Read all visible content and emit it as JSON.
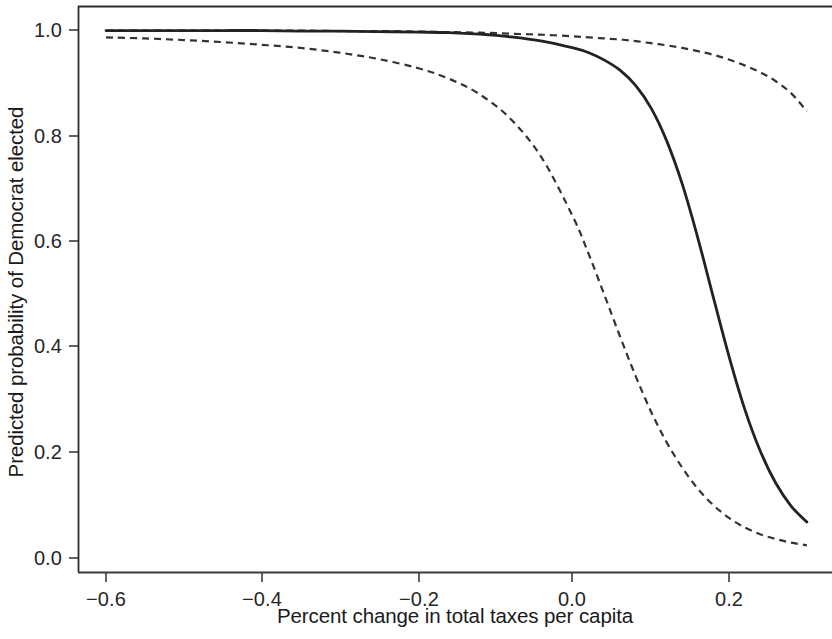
{
  "chart_data": {
    "type": "line",
    "title": "",
    "xlabel": "Percent change in total taxes per capita",
    "ylabel": "Predicted probability of Democrat elected",
    "xlim": [
      -0.6,
      0.3
    ],
    "ylim": [
      0.0,
      1.02
    ],
    "grid": false,
    "legend": "none",
    "xticks": [
      "-0.6",
      "-0.4",
      "-0.2",
      "0.0",
      "0.2"
    ],
    "xtick_values": [
      -0.6,
      -0.4,
      -0.2,
      0.0,
      0.2
    ],
    "yticks": [
      "0.0",
      "0.2",
      "0.4",
      "0.6",
      "0.8",
      "1.0"
    ],
    "ytick_values": [
      0.0,
      0.2,
      0.4,
      0.6,
      0.8,
      1.0
    ],
    "x": [
      -0.6,
      -0.55,
      -0.5,
      -0.45,
      -0.4,
      -0.35,
      -0.3,
      -0.25,
      -0.2,
      -0.16,
      -0.12,
      -0.08,
      -0.04,
      0.0,
      0.02,
      0.04,
      0.06,
      0.08,
      0.1,
      0.12,
      0.14,
      0.16,
      0.18,
      0.2,
      0.22,
      0.24,
      0.26,
      0.28,
      0.3
    ],
    "series": [
      {
        "name": "Predicted probability",
        "style": "solid",
        "color": "#222222",
        "values": [
          0.999,
          0.999,
          0.999,
          0.999,
          0.999,
          0.998,
          0.998,
          0.997,
          0.996,
          0.995,
          0.992,
          0.987,
          0.979,
          0.966,
          0.957,
          0.943,
          0.924,
          0.895,
          0.852,
          0.79,
          0.708,
          0.606,
          0.493,
          0.382,
          0.283,
          0.203,
          0.142,
          0.098,
          0.068
        ],
        "note": "solid center line, logistic midpoint approx x=0.093"
      },
      {
        "name": "Upper confidence bound",
        "style": "dashed",
        "color": "#333333",
        "values": [
          0.999,
          0.999,
          0.999,
          0.999,
          0.999,
          0.999,
          0.998,
          0.998,
          0.997,
          0.996,
          0.995,
          0.993,
          0.991,
          0.988,
          0.986,
          0.984,
          0.982,
          0.979,
          0.975,
          0.971,
          0.966,
          0.96,
          0.953,
          0.944,
          0.933,
          0.92,
          0.903,
          0.88,
          0.846
        ],
        "note": "upper dashed band, overlaps solid line at left edge, ends near 0.84"
      },
      {
        "name": "Lower confidence bound",
        "style": "dashed",
        "color": "#333333",
        "values": [
          0.986,
          0.984,
          0.981,
          0.977,
          0.972,
          0.966,
          0.957,
          0.945,
          0.928,
          0.908,
          0.878,
          0.831,
          0.757,
          0.645,
          0.575,
          0.498,
          0.42,
          0.345,
          0.277,
          0.219,
          0.171,
          0.131,
          0.1,
          0.076,
          0.058,
          0.045,
          0.036,
          0.029,
          0.024
        ],
        "note": "lower dashed band, logistic midpoint approx x=-0.031"
      }
    ]
  },
  "axes": {
    "y_tick_labels": [
      {
        "value": 1.0,
        "label": "1.0"
      },
      {
        "value": 0.8,
        "label": "0.8"
      },
      {
        "value": 0.6,
        "label": "0.6"
      },
      {
        "value": 0.4,
        "label": "0.4"
      },
      {
        "value": 0.2,
        "label": "0.2"
      },
      {
        "value": 0.0,
        "label": "0.0"
      }
    ],
    "x_tick_labels": [
      {
        "value": -0.6,
        "label": "−0.6"
      },
      {
        "value": -0.4,
        "label": "−0.4"
      },
      {
        "value": -0.2,
        "label": "−0.2"
      },
      {
        "value": 0.0,
        "label": "0.0"
      },
      {
        "value": 0.2,
        "label": "0.2"
      }
    ],
    "y_axis_title": "Predicted probability of Democrat elected",
    "x_axis_title": "Percent change in total taxes per capita"
  }
}
